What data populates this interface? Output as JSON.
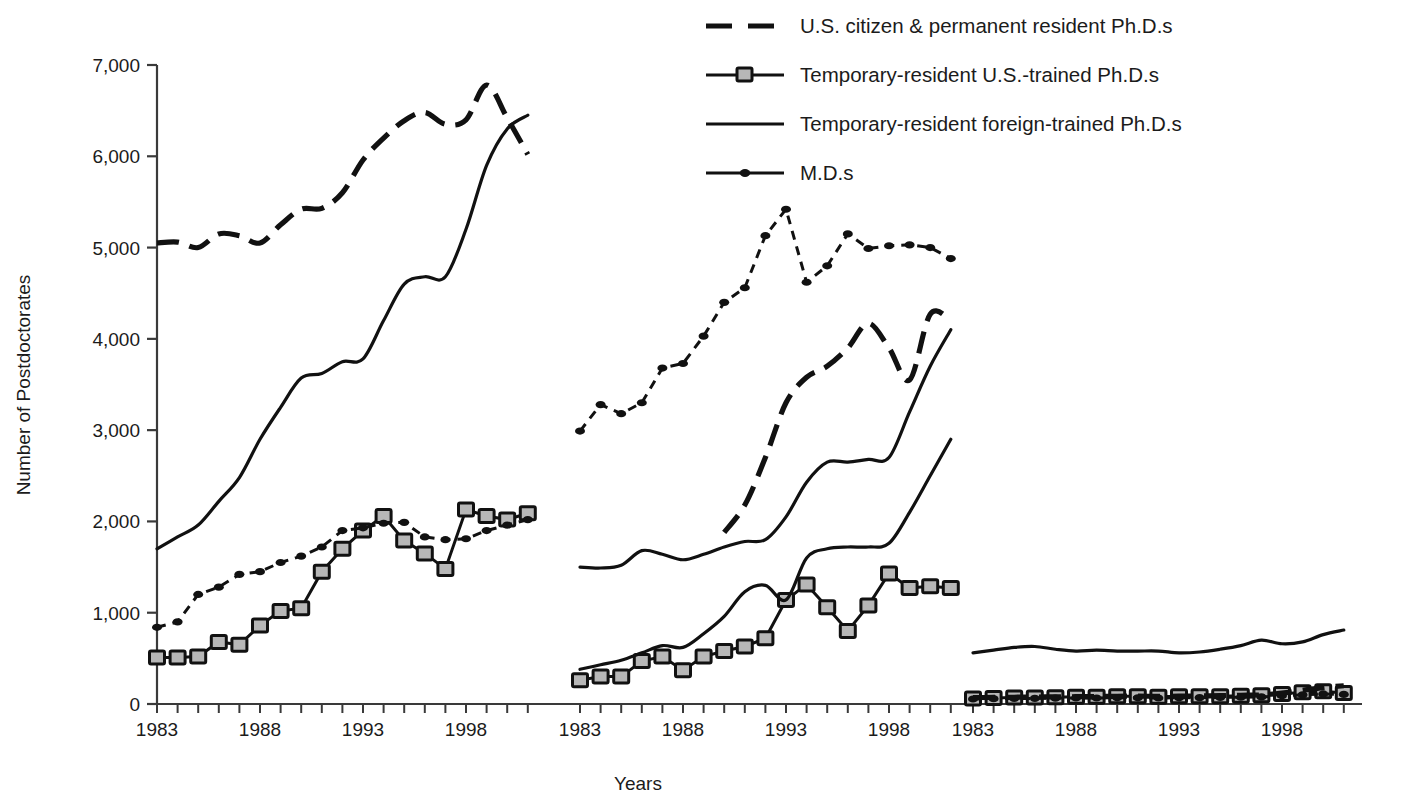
{
  "chart_data": {
    "type": "line",
    "title": "",
    "xlabel": "Years",
    "ylabel": "Number of Postdoctorates",
    "ylim": [
      0,
      7000
    ],
    "ytick_labels": [
      "0",
      "1,000",
      "2,000",
      "3,000",
      "4,000",
      "5,000",
      "6,000",
      "7,000"
    ],
    "ytick_values": [
      0,
      1000,
      2000,
      3000,
      4000,
      5000,
      6000,
      7000
    ],
    "grid": false,
    "legend_position": "top-right",
    "x": [
      1983,
      1984,
      1985,
      1986,
      1987,
      1988,
      1989,
      1990,
      1991,
      1992,
      1993,
      1994,
      1995,
      1996,
      1997,
      1998,
      1999,
      2000,
      2001
    ],
    "xtick_labels": [
      "1983",
      "1988",
      "1993",
      "1998"
    ],
    "xtick_label_values": [
      1983,
      1988,
      1993,
      1998
    ],
    "panels": [
      {
        "name": "panel-1",
        "xtick_labels": [
          "1983",
          "1988",
          "1993",
          "1998"
        ],
        "series": [
          {
            "name": "U.S. citizen & permanent resident Ph.D.s",
            "style": "dashed",
            "values": [
              5050,
              5060,
              5000,
              5150,
              5130,
              5050,
              5250,
              5420,
              5430,
              5600,
              5960,
              6200,
              6390,
              6480,
              6350,
              6400,
              6780,
              6420,
              6020
            ]
          },
          {
            "name": "Temporary-resident U.S.-trained Ph.D.s",
            "style": "square-marker",
            "values": [
              510,
              510,
              520,
              680,
              650,
              860,
              1020,
              1050,
              1450,
              1700,
              1900,
              2060,
              1790,
              1650,
              1480,
              2130,
              2060,
              2020,
              2090
            ]
          },
          {
            "name": "Temporary-resident foreign-trained Ph.D.s",
            "style": "solid",
            "values": [
              1700,
              1830,
              1960,
              2220,
              2480,
              2900,
              3250,
              3570,
              3620,
              3750,
              3780,
              4200,
              4600,
              4680,
              4680,
              5200,
              5900,
              6300,
              6450
            ]
          },
          {
            "name": "M.D.s",
            "style": "dotted-marker",
            "values": [
              840,
              900,
              1200,
              1280,
              1420,
              1450,
              1550,
              1620,
              1720,
              1900,
              1930,
              1980,
              1990,
              1830,
              1800,
              1810,
              1900,
              1960,
              2020
            ]
          }
        ]
      },
      {
        "name": "panel-2",
        "xtick_labels": [
          "1983",
          "1988",
          "1993",
          "1998"
        ],
        "series": [
          {
            "name": "U.S. citizen & permanent resident Ph.D.s",
            "style": "dashed",
            "values": [
              null,
              null,
              null,
              null,
              null,
              null,
              null,
              1880,
              2180,
              2700,
              3300,
              3580,
              3700,
              3900,
              4170,
              3900,
              3550,
              4270,
              4200
            ]
          },
          {
            "name": "Temporary-resident U.S.-trained Ph.D.s",
            "style": "square-marker",
            "values": [
              260,
              300,
              300,
              470,
              520,
              370,
              520,
              580,
              630,
              720,
              1140,
              1310,
              1060,
              800,
              1080,
              1430,
              1270,
              1290,
              1270
            ]
          },
          {
            "name": "Temporary-resident foreign-trained Ph.D.s",
            "style": "solid",
            "values": [
              1500,
              1490,
              1520,
              1680,
              1640,
              1580,
              1640,
              1720,
              1780,
              1800,
              2050,
              2430,
              2650,
              2650,
              2680,
              2700,
              3200,
              3700,
              4100
            ]
          },
          {
            "name": "M.D.s",
            "style": "dotted-marker",
            "values": [
              2990,
              3280,
              3180,
              3300,
              3680,
              3730,
              4030,
              4400,
              4560,
              5130,
              5420,
              4620,
              4800,
              5150,
              4990,
              5020,
              5030,
              5000,
              4880
            ]
          }
        ],
        "extra_solid_low": {
          "name": "Temporary-resident foreign-trained Ph.D.s (low segment)",
          "values": [
            380,
            430,
            480,
            560,
            640,
            620,
            770,
            960,
            1230,
            1300,
            1140,
            1600,
            1700,
            1720,
            1720,
            1760,
            2100,
            2500,
            2900
          ]
        }
      },
      {
        "name": "panel-3",
        "xtick_labels": [
          "1983",
          "1988",
          "1993",
          "1998"
        ],
        "series": [
          {
            "name": "Temporary-resident foreign-trained Ph.D.s",
            "style": "solid",
            "values": [
              560,
              590,
              620,
              630,
              600,
              580,
              590,
              580,
              580,
              580,
              560,
              570,
              600,
              640,
              700,
              660,
              680,
              760,
              810
            ]
          },
          {
            "name": "Temporary-resident U.S.-trained Ph.D.s",
            "style": "square-marker",
            "values": [
              60,
              65,
              70,
              70,
              75,
              80,
              80,
              85,
              85,
              80,
              85,
              85,
              85,
              90,
              95,
              110,
              130,
              140,
              120
            ]
          },
          {
            "name": "M.D.s",
            "style": "dotted-marker",
            "values": [
              55,
              58,
              60,
              62,
              64,
              66,
              66,
              68,
              68,
              66,
              68,
              70,
              72,
              74,
              78,
              90,
              100,
              110,
              105
            ]
          },
          {
            "name": "U.S. citizen & permanent resident Ph.D.s",
            "style": "dashed",
            "values": [
              70,
              72,
              74,
              76,
              78,
              80,
              82,
              84,
              86,
              84,
              86,
              88,
              92,
              96,
              100,
              120,
              150,
              180,
              200
            ]
          }
        ]
      }
    ],
    "legend": [
      {
        "label": "U.S. citizen & permanent resident Ph.D.s",
        "style": "dashed",
        "marker": "none"
      },
      {
        "label": "Temporary-resident U.S.-trained Ph.D.s",
        "style": "solid",
        "marker": "square"
      },
      {
        "label": "Temporary-resident foreign-trained Ph.D.s",
        "style": "solid",
        "marker": "none"
      },
      {
        "label": "M.D.s",
        "style": "solid",
        "marker": "dot"
      }
    ],
    "colors": {
      "line": "#111111",
      "marker_fill": "#b7b7b7",
      "marker_stroke": "#111111",
      "axis": "#3a3a3a",
      "text": "#1b1b1b",
      "background": "#ffffff"
    }
  }
}
